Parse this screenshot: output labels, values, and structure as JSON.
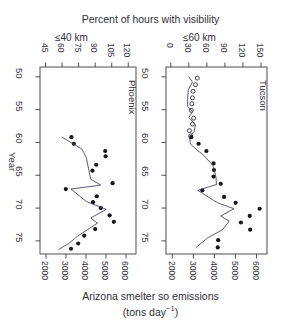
{
  "chart_data": {
    "type": "scatter",
    "title": "Percent of  hours with visibility",
    "xlabel_bottom_line1": "Arizona smelter so emissions",
    "xlabel_bottom_line2_prefix": "(tons  day",
    "xlabel_bottom_line2_exp": "−1",
    "xlabel_bottom_line2_suffix": ")",
    "ylabel": "Year",
    "ylim": [
      48.5,
      77
    ],
    "yticks": [
      50,
      55,
      60,
      65,
      70,
      75
    ],
    "ytick_labels": [
      "50",
      "55",
      "60",
      "65",
      "70",
      "75"
    ],
    "bottom_axis_label": "Arizona smelter so emissions (tons day−1)",
    "bottom_xlim": [
      1700,
      6500
    ],
    "bottom_xticks": [
      2000,
      3000,
      4000,
      5000,
      6000
    ],
    "bottom_xtick_labels": [
      "2000",
      "3000",
      "4000",
      "5000",
      "6000"
    ],
    "grid": false,
    "legend_position": "none",
    "panels": [
      {
        "name": "Phoenix",
        "subtitle": "≤40 km",
        "top_xlim": [
          40,
          127
        ],
        "top_xticks": [
          45,
          60,
          75,
          90,
          105,
          120
        ],
        "top_xtick_labels": [
          "45",
          "60",
          "75",
          "90",
          "105",
          "120"
        ],
        "series": [
          {
            "name": "Phoenix emissions vs year",
            "marker": "filled-circle",
            "x_axis": "bottom",
            "points": [
              {
                "year": 59.2,
                "emissions": 3270
              },
              {
                "year": 60.2,
                "emissions": 3390
              },
              {
                "year": 61.3,
                "emissions": 4960
              },
              {
                "year": 62.1,
                "emissions": 4980
              },
              {
                "year": 63.4,
                "emissions": 4510
              },
              {
                "year": 64.3,
                "emissions": 4320
              },
              {
                "year": 66.2,
                "emissions": 5330
              },
              {
                "year": 67.1,
                "emissions": 2990
              },
              {
                "year": 68.2,
                "emissions": 4540
              },
              {
                "year": 69.1,
                "emissions": 4350
              },
              {
                "year": 70.0,
                "emissions": 4740
              },
              {
                "year": 71.1,
                "emissions": 5180
              },
              {
                "year": 72.1,
                "emissions": 5390
              },
              {
                "year": 73.2,
                "emissions": 4460
              },
              {
                "year": 74.2,
                "emissions": 3910
              },
              {
                "year": 75.4,
                "emissions": 3610
              },
              {
                "year": 76.2,
                "emissions": 3250
              }
            ]
          },
          {
            "name": "Phoenix visibility line",
            "marker": "line",
            "x_axis": "top",
            "points": [
              {
                "year": 59.2,
                "percent": 60
              },
              {
                "year": 61.0,
                "percent": 78
              },
              {
                "year": 62.3,
                "percent": 82
              },
              {
                "year": 64.0,
                "percent": 84
              },
              {
                "year": 65.6,
                "percent": 86
              },
              {
                "year": 66.5,
                "percent": 95
              },
              {
                "year": 67.1,
                "percent": 68
              },
              {
                "year": 69.0,
                "percent": 82
              },
              {
                "year": 70.2,
                "percent": 100
              },
              {
                "year": 71.5,
                "percent": 86
              },
              {
                "year": 72.3,
                "percent": 92
              },
              {
                "year": 73.3,
                "percent": 83
              },
              {
                "year": 74.3,
                "percent": 74
              },
              {
                "year": 75.4,
                "percent": 66
              },
              {
                "year": 76.3,
                "percent": 57
              }
            ]
          }
        ]
      },
      {
        "name": "Tucson",
        "subtitle": "≤60 km",
        "top_xlim": [
          -8,
          160
        ],
        "top_xticks": [
          0,
          30,
          60,
          90,
          120,
          150
        ],
        "top_xtick_labels": [
          "0",
          "30",
          "60",
          "90",
          "120",
          "150"
        ],
        "series": [
          {
            "name": "Tucson early visibility",
            "marker": "open-circle",
            "x_axis": "top",
            "points": [
              {
                "year": 50.2,
                "percent": 44
              },
              {
                "year": 51.2,
                "percent": 41
              },
              {
                "year": 52.2,
                "percent": 37
              },
              {
                "year": 53.2,
                "percent": 36
              },
              {
                "year": 54.1,
                "percent": 35
              },
              {
                "year": 55.1,
                "percent": 34
              },
              {
                "year": 56.3,
                "percent": 38
              },
              {
                "year": 57.2,
                "percent": 36
              },
              {
                "year": 58.2,
                "percent": 31
              },
              {
                "year": 59.0,
                "percent": 33
              }
            ]
          },
          {
            "name": "Tucson emissions vs year",
            "marker": "filled-circle",
            "x_axis": "bottom",
            "points": [
              {
                "year": 59.2,
                "emissions": 2900
              },
              {
                "year": 60.2,
                "emissions": 3250
              },
              {
                "year": 61.3,
                "emissions": 3620
              },
              {
                "year": 63.2,
                "emissions": 3960
              },
              {
                "year": 64.2,
                "emissions": 3980
              },
              {
                "year": 65.2,
                "emissions": 3960
              },
              {
                "year": 66.3,
                "emissions": 4300
              },
              {
                "year": 67.3,
                "emissions": 3430
              },
              {
                "year": 68.3,
                "emissions": 4460
              },
              {
                "year": 69.2,
                "emissions": 5010
              },
              {
                "year": 70.1,
                "emissions": 6150
              },
              {
                "year": 71.2,
                "emissions": 5680
              },
              {
                "year": 72.2,
                "emissions": 5260
              },
              {
                "year": 73.3,
                "emissions": 5700
              },
              {
                "year": 74.9,
                "emissions": 4180
              },
              {
                "year": 76.0,
                "emissions": 4160
              }
            ]
          },
          {
            "name": "Tucson visibility line",
            "marker": "line",
            "x_axis": "top",
            "points": [
              {
                "year": 50.0,
                "percent": 30
              },
              {
                "year": 50.8,
                "percent": 36
              },
              {
                "year": 52.0,
                "percent": 29
              },
              {
                "year": 53.3,
                "percent": 28
              },
              {
                "year": 54.5,
                "percent": 28
              },
              {
                "year": 55.3,
                "percent": 36
              },
              {
                "year": 56.2,
                "percent": 30
              },
              {
                "year": 57.3,
                "percent": 41
              },
              {
                "year": 58.3,
                "percent": 39
              },
              {
                "year": 59.2,
                "percent": 31
              },
              {
                "year": 60.3,
                "percent": 33
              },
              {
                "year": 62.0,
                "percent": 55
              },
              {
                "year": 63.5,
                "percent": 70
              },
              {
                "year": 65.2,
                "percent": 75
              },
              {
                "year": 66.4,
                "percent": 76
              },
              {
                "year": 67.3,
                "percent": 45
              },
              {
                "year": 68.3,
                "percent": 62
              },
              {
                "year": 69.2,
                "percent": 78
              },
              {
                "year": 70.1,
                "percent": 105
              },
              {
                "year": 71.2,
                "percent": 83
              },
              {
                "year": 72.0,
                "percent": 97
              },
              {
                "year": 73.3,
                "percent": 86
              },
              {
                "year": 74.5,
                "percent": 62
              },
              {
                "year": 76.0,
                "percent": 42
              }
            ]
          }
        ]
      }
    ]
  },
  "colors": {
    "axis": "#3a3a44",
    "text": "#2f2f38",
    "marker": "#16161c",
    "line": "#3f3f58",
    "background": "#ffffff"
  }
}
